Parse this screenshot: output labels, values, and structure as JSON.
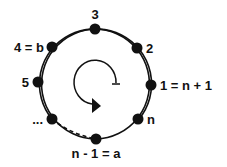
{
  "diagram": {
    "type": "cycle",
    "circle": {
      "cx": 95,
      "cy": 84,
      "r": 55
    },
    "nodes": [
      {
        "id": "node-3",
        "label": "3",
        "x": 95,
        "y": 29,
        "lx": 95,
        "ly": 19,
        "anchor": "middle"
      },
      {
        "id": "node-2",
        "label": "2",
        "x": 137,
        "y": 48,
        "lx": 146,
        "ly": 53,
        "anchor": "start"
      },
      {
        "id": "node-1",
        "label": "1 = n + 1",
        "x": 151,
        "y": 85,
        "lx": 160,
        "ly": 90,
        "anchor": "start"
      },
      {
        "id": "node-n",
        "label": "n",
        "x": 138,
        "y": 119,
        "lx": 147,
        "ly": 124,
        "anchor": "start"
      },
      {
        "id": "node-a",
        "label": "n - 1 = a",
        "x": 96,
        "y": 139,
        "lx": 96,
        "ly": 158,
        "anchor": "middle"
      },
      {
        "id": "node-dots",
        "label": "...",
        "x": 52,
        "y": 119,
        "lx": 43,
        "ly": 124,
        "anchor": "end"
      },
      {
        "id": "node-5",
        "label": "5",
        "x": 38,
        "y": 82,
        "lx": 29,
        "ly": 87,
        "anchor": "end"
      },
      {
        "id": "node-b",
        "label": "4 = b",
        "x": 52,
        "y": 47,
        "lx": 44,
        "ly": 52,
        "anchor": "end"
      }
    ],
    "dashed_segment": {
      "from": "node-dots",
      "to": "node-a"
    },
    "rotation_arrow": {
      "direction": "counterclockwise-then-down",
      "center_x": 96,
      "center_y": 84
    },
    "colors": {
      "line": "#111111",
      "node": "#111111",
      "background": "#ffffff"
    }
  }
}
